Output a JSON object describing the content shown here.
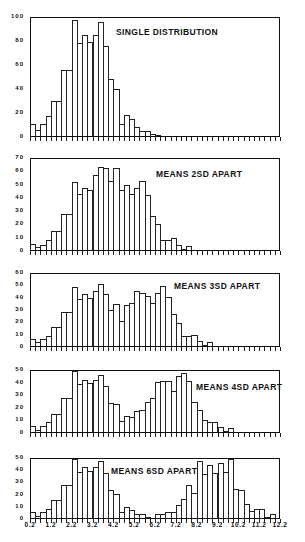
{
  "chart_data": [
    {
      "type": "bar",
      "title": "SINGLE DISTRIBUTION",
      "bin_start": 0.2,
      "bin_width": 0.25,
      "ylim": [
        0,
        100
      ],
      "yticks": [
        "0",
        "20",
        "40",
        "60",
        "80",
        "100"
      ],
      "values": [
        10,
        5,
        10,
        17,
        30,
        30,
        56,
        56,
        98,
        79,
        86,
        80,
        86,
        97,
        76,
        48,
        40,
        10,
        18,
        14,
        8,
        4,
        4,
        2,
        1,
        0,
        0,
        0,
        0,
        0,
        0,
        0,
        0,
        0,
        0,
        0,
        0,
        0,
        0,
        0,
        0,
        0,
        0,
        0,
        0,
        0,
        0,
        0
      ]
    },
    {
      "type": "bar",
      "title": "MEANS 2SD APART",
      "bin_start": 0.2,
      "bin_width": 0.25,
      "ylim": [
        0,
        70
      ],
      "yticks": [
        "0",
        "10",
        "20",
        "30",
        "40",
        "50",
        "60",
        "70"
      ],
      "values": [
        5,
        2,
        4,
        8,
        15,
        15,
        28,
        28,
        52,
        43,
        48,
        46,
        58,
        64,
        63,
        53,
        63,
        46,
        50,
        43,
        48,
        53,
        42,
        26,
        20,
        8,
        8,
        9,
        4,
        1,
        3,
        0,
        0,
        0,
        0,
        0,
        0,
        0,
        0,
        0,
        0,
        0,
        0,
        0,
        0,
        0,
        0,
        0
      ]
    },
    {
      "type": "bar",
      "title": "MEANS 3SD APART",
      "bin_start": 0.2,
      "bin_width": 0.25,
      "ylim": [
        0,
        60
      ],
      "yticks": [
        "0",
        "10",
        "20",
        "30",
        "40",
        "50",
        "60"
      ],
      "values": [
        6,
        3,
        6,
        8,
        16,
        16,
        28,
        28,
        49,
        39,
        43,
        40,
        46,
        52,
        43,
        30,
        35,
        21,
        34,
        36,
        46,
        44,
        42,
        36,
        44,
        50,
        41,
        27,
        19,
        8,
        8,
        9,
        4,
        1,
        3,
        0,
        0,
        0,
        0,
        0,
        0,
        0,
        0,
        0,
        0,
        0,
        0,
        0
      ]
    },
    {
      "type": "bar",
      "title": "MEANS 4SD APART",
      "bin_start": 0.2,
      "bin_width": 0.25,
      "ylim": [
        0,
        50
      ],
      "yticks": [
        "0",
        "10",
        "20",
        "30",
        "40",
        "50"
      ],
      "values": [
        5,
        2,
        5,
        8,
        15,
        15,
        28,
        28,
        50,
        39,
        43,
        40,
        43,
        47,
        38,
        24,
        23,
        9,
        13,
        12,
        17,
        18,
        25,
        28,
        41,
        42,
        42,
        34,
        46,
        48,
        42,
        25,
        18,
        10,
        8,
        8,
        4,
        1,
        3,
        0,
        0,
        0,
        0,
        0,
        0,
        0,
        0,
        0
      ]
    },
    {
      "type": "bar",
      "title": "MEANS 6SD APART",
      "bin_start": 0.2,
      "bin_width": 0.25,
      "ylim": [
        0,
        50
      ],
      "yticks": [
        "0",
        "10",
        "20",
        "30",
        "40",
        "50"
      ],
      "values": [
        5,
        2,
        5,
        8,
        15,
        15,
        28,
        28,
        50,
        39,
        43,
        40,
        43,
        48,
        38,
        24,
        20,
        5,
        9,
        7,
        3,
        3,
        1,
        0,
        3,
        3,
        5,
        5,
        11,
        16,
        28,
        21,
        48,
        37,
        45,
        38,
        47,
        39,
        50,
        25,
        24,
        12,
        6,
        8,
        8,
        1,
        3,
        0
      ]
    }
  ],
  "xaxis": {
    "ticks": [
      "0.2",
      "1.2",
      "2.2",
      "3.2",
      "4.2",
      "5.2",
      "6.2",
      "7.2",
      "8.2",
      "9.2",
      "10.2",
      "11.2",
      "12.2"
    ],
    "range": [
      0.2,
      12.2
    ]
  },
  "layout": {
    "panels": [
      {
        "top": 17,
        "height": 120,
        "title_left": 116,
        "title_top": 27
      },
      {
        "top": 158,
        "height": 93,
        "title_left": 156,
        "title_top": 169
      },
      {
        "top": 273,
        "height": 74,
        "title_left": 174,
        "title_top": 281
      },
      {
        "top": 370,
        "height": 63,
        "title_left": 196,
        "title_top": 382
      },
      {
        "top": 458,
        "height": 61,
        "title_left": 111,
        "title_top": 466
      }
    ]
  }
}
